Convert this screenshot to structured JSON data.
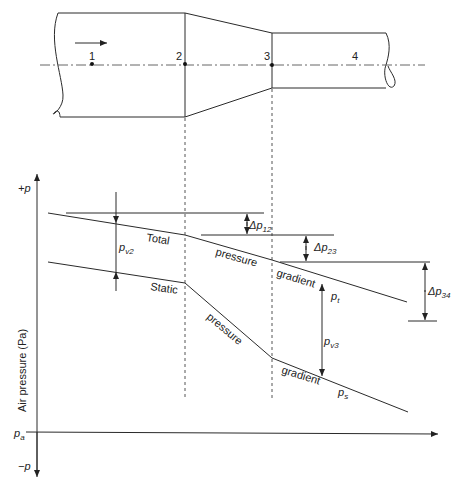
{
  "diagram": {
    "duct": {
      "stations": [
        "1",
        "2",
        "3",
        "4"
      ],
      "flow_direction": "left-to-right"
    },
    "axis": {
      "y_positive": "+p",
      "y_negative": "−p",
      "y_label": "Air pressure (Pa)",
      "x_origin": "p",
      "x_origin_sub": "a"
    },
    "curves": {
      "total_label_1": "Total",
      "total_label_2": "pressure",
      "total_label_3": "gradient",
      "total_symbol": "p",
      "total_symbol_sub": "t",
      "static_label_1": "Static",
      "static_label_2": "pressure",
      "static_label_3": "gradient",
      "static_symbol": "p",
      "static_symbol_sub": "s"
    },
    "annotations": {
      "pv2": "p",
      "pv2_sub": "v2",
      "pv3": "p",
      "pv3_sub": "v3",
      "dp12": "Δp",
      "dp12_sub": "12",
      "dp23": "Δp",
      "dp23_sub": "23",
      "dp34": "Δp",
      "dp34_sub": "34"
    },
    "colors": {
      "line": "#2a2a2a",
      "background": "#ffffff"
    }
  }
}
